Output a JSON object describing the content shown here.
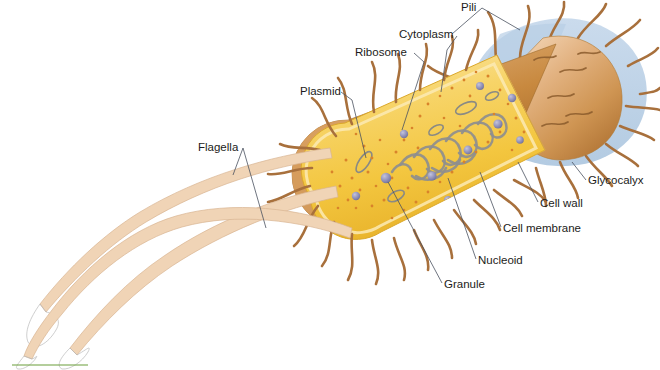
{
  "figure": {
    "background_color": "#ffffff",
    "width": 660,
    "height": 370
  },
  "labels": [
    {
      "id": "pili",
      "text": "Pili",
      "x": 461,
      "y": 11,
      "anchor": "start"
    },
    {
      "id": "cytoplasm",
      "text": "Cytoplasm",
      "x": 399,
      "y": 38,
      "anchor": "start"
    },
    {
      "id": "ribosome",
      "text": "Ribosome",
      "x": 355,
      "y": 56,
      "anchor": "start"
    },
    {
      "id": "plasmid",
      "text": "Plasmid",
      "x": 300,
      "y": 95,
      "anchor": "start"
    },
    {
      "id": "flagella",
      "text": "Flagella",
      "x": 198,
      "y": 151,
      "anchor": "start"
    },
    {
      "id": "glycocalyx",
      "text": "Glycocalyx",
      "x": 588,
      "y": 184,
      "anchor": "start"
    },
    {
      "id": "cell-wall",
      "text": "Cell wall",
      "x": 540,
      "y": 207,
      "anchor": "start"
    },
    {
      "id": "cell-membrane",
      "text": "Cell membrane",
      "x": 503,
      "y": 232,
      "anchor": "start"
    },
    {
      "id": "nucleoid",
      "text": "Nucleoid",
      "x": 478,
      "y": 264,
      "anchor": "start"
    },
    {
      "id": "granule",
      "text": "Granule",
      "x": 444,
      "y": 288,
      "anchor": "start"
    }
  ],
  "colors": {
    "cytoplasm": "#f5c842",
    "cytoplasm_light": "#fae6ab",
    "cell_wall": "#c8893f",
    "cell_wall_light": "#e0b183",
    "glycocalyx": "#b8cfe6",
    "membrane": "#f3ece0",
    "pili": "#a8703c",
    "flagella": "#f0d4b6",
    "ribosome": "#d9832a",
    "granule": "#8f8fb5",
    "nucleoid": "#8e8e8e",
    "plasmid": "#8a8a84",
    "leader_line": "#4a5260",
    "label_text": "#1c1c20",
    "scale_bar": "#7aa84f"
  },
  "structures": {
    "glycocalyx_label": "glycocalyx-halo",
    "cell_wall_label": "cell-wall-cylinder",
    "membrane_label": "cell-membrane-band",
    "cytoplasm_label": "cytoplasm-region",
    "nucleoid_label": "nucleoid-dna",
    "plasmid_label": "plasmid-rings",
    "ribosome_label": "ribosome-dots",
    "granule_label": "granule-spheres",
    "pili_label": "pili-strands",
    "flagella_label": "flagella-ribbons"
  },
  "scale_bar": {
    "x1": 12,
    "y1": 365,
    "x2": 88,
    "y2": 365
  }
}
